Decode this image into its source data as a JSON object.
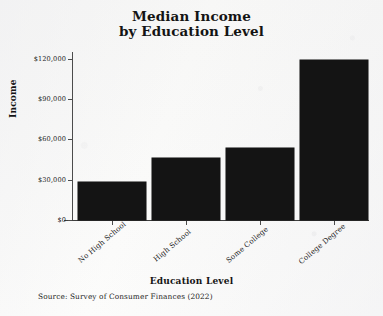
{
  "chart_data": {
    "type": "bar",
    "title": "Median Income by Education Level",
    "title_lines": [
      "Median Income",
      "by Education Level"
    ],
    "categories": [
      "No High School",
      "High School",
      "Some College",
      "College Degree"
    ],
    "values": [
      28000,
      46500,
      53500,
      119000
    ],
    "xlabel": "Education Level",
    "ylabel": "Income",
    "ylim": [
      0,
      125000
    ],
    "yticks": [
      0,
      30000,
      60000,
      90000,
      120000
    ],
    "ytick_labels": [
      "$0",
      "$30,000",
      "$60,000",
      "$90,000",
      "$120,000"
    ],
    "grid": false,
    "legend": false,
    "bar_color": "#141414",
    "background_color": "#fbfbfa",
    "axis_color": "#4c4c4c",
    "source_note": "Source:  Survey of Consumer Finances (2022)"
  }
}
